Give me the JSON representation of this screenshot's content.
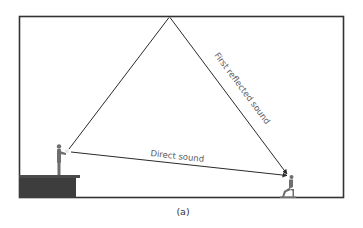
{
  "figure": {
    "caption": "(a)",
    "labels": {
      "direct": "Direct sound",
      "reflected": "First reflected sound"
    },
    "colors": {
      "line": "#2a2a2a",
      "room": "#333333",
      "stage": "#3d3d3d",
      "figure": "#6e6e6e",
      "text": "#5a5a5a",
      "background": "#ffffff"
    }
  }
}
